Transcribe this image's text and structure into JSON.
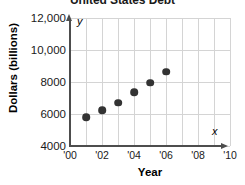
{
  "chart_data": {
    "type": "scatter",
    "title": "United States Debt",
    "xlabel": "Year",
    "ylabel": "Dollars (billions)",
    "x_axis_variable": "x",
    "y_axis_variable": "y",
    "xlim": [
      2000,
      2010
    ],
    "ylim": [
      4000,
      12000
    ],
    "x_tick_labels": [
      "'00",
      "'02",
      "'04",
      "'06",
      "'08",
      "'10"
    ],
    "x_tick_values": [
      2000,
      2002,
      2004,
      2006,
      2008,
      2010
    ],
    "y_tick_labels": [
      "4000",
      "6000",
      "8000",
      "10,000",
      "12,000"
    ],
    "y_tick_values": [
      4000,
      6000,
      8000,
      10000,
      12000
    ],
    "grid": true,
    "legend": null,
    "point_color": "#333333",
    "grid_color": "#d4d4d4",
    "axis_color": "#4d4d4d",
    "x": [
      2001,
      2002,
      2003,
      2004,
      2005,
      2006
    ],
    "values": [
      5800,
      6250,
      6700,
      7350,
      7950,
      8650
    ],
    "points": [
      {
        "x": 2001,
        "y": 5800,
        "label": "'01"
      },
      {
        "x": 2002,
        "y": 6250,
        "label": "'02"
      },
      {
        "x": 2003,
        "y": 6700,
        "label": "'03"
      },
      {
        "x": 2004,
        "y": 7350,
        "label": "'04"
      },
      {
        "x": 2005,
        "y": 7950,
        "label": "'05"
      },
      {
        "x": 2006,
        "y": 8650,
        "label": "'06"
      }
    ]
  }
}
